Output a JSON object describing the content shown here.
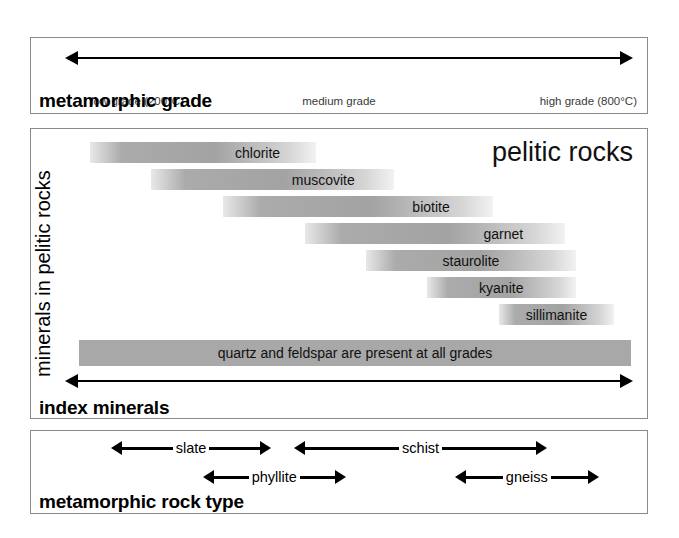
{
  "grade_panel": {
    "heading": "metamorphic grade",
    "arrow_name": "grade-axis-arrow",
    "captions": {
      "low": "low grade (200°C)",
      "medium": "medium grade",
      "high": "high grade (800°C)"
    }
  },
  "minerals_panel": {
    "title": "pelitic rocks",
    "axis_label": "minerals in pelitic rocks",
    "heading": "index minerals",
    "all_grades_label": "quartz and feldspar are present at all grades",
    "bars": [
      {
        "name": "chlorite",
        "label": "chlorite",
        "start_pct": 2,
        "end_pct": 43,
        "label_align": "right"
      },
      {
        "name": "muscovite",
        "label": "muscovite",
        "start_pct": 13,
        "end_pct": 57,
        "label_align": "right"
      },
      {
        "name": "biotite",
        "label": "biotite",
        "start_pct": 26,
        "end_pct": 75,
        "label_align": "right"
      },
      {
        "name": "garnet",
        "label": "garnet",
        "start_pct": 41,
        "end_pct": 88,
        "label_align": "right"
      },
      {
        "name": "staurolite",
        "label": "staurolite",
        "start_pct": 52,
        "end_pct": 90,
        "label_align": "center"
      },
      {
        "name": "kyanite",
        "label": "kyanite",
        "start_pct": 63,
        "end_pct": 90,
        "label_align": "center"
      },
      {
        "name": "sillimanite",
        "label": "sillimanite",
        "start_pct": 76,
        "end_pct": 97,
        "label_align": "center"
      }
    ]
  },
  "rocktype_panel": {
    "heading": "metamorphic rock type",
    "ranges": [
      {
        "name": "slate",
        "label": "slate",
        "row": 0,
        "start_pct": 9,
        "end_pct": 37
      },
      {
        "name": "schist",
        "label": "schist",
        "row": 0,
        "start_pct": 41,
        "end_pct": 85
      },
      {
        "name": "phyllite",
        "label": "phyllite",
        "row": 1,
        "start_pct": 25,
        "end_pct": 50
      },
      {
        "name": "gneiss",
        "label": "gneiss",
        "row": 1,
        "start_pct": 69,
        "end_pct": 94
      }
    ]
  },
  "chart_data": {
    "type": "bar",
    "xlabel": "metamorphic grade",
    "ylabel": "minerals in pelitic rocks",
    "x_axis_ticks": [
      "low grade (200°C)",
      "medium grade",
      "high grade (800°C)"
    ],
    "x_range_celsius": [
      200,
      800
    ],
    "grid": false,
    "legend": "none",
    "categories": [
      "chlorite",
      "muscovite",
      "biotite",
      "garnet",
      "staurolite",
      "kyanite",
      "sillimanite",
      "quartz and feldspar"
    ],
    "series": [
      {
        "name": "stability range start (% of axis)",
        "values": [
          2,
          13,
          26,
          41,
          52,
          63,
          76,
          0
        ]
      },
      {
        "name": "stability range end (% of axis)",
        "values": [
          43,
          57,
          75,
          88,
          90,
          90,
          97,
          100
        ]
      }
    ],
    "annotations": [
      "pelitic rocks",
      "quartz and feldspar are present at all grades",
      "index minerals",
      "metamorphic rock type"
    ],
    "rock_types": [
      {
        "name": "slate",
        "start_pct": 9,
        "end_pct": 37
      },
      {
        "name": "phyllite",
        "start_pct": 25,
        "end_pct": 50
      },
      {
        "name": "schist",
        "start_pct": 41,
        "end_pct": 85
      },
      {
        "name": "gneiss",
        "start_pct": 69,
        "end_pct": 94
      }
    ]
  }
}
